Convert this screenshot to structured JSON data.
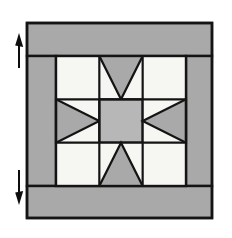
{
  "diagram": {
    "canvas": {
      "width": 232,
      "height": 238,
      "background": "#ffffff"
    },
    "colors": {
      "border_gray": "#a9a9a9",
      "star_gray": "#a9a9a9",
      "center_gray": "#b7b7b7",
      "background_white": "#f6f6f3",
      "outline_black": "#141414",
      "arrow_black": "#0d0d0d",
      "page_white": "#ffffff"
    },
    "block": {
      "label": "quilt-block",
      "outer": {
        "x": 27,
        "y": 23,
        "width": 185,
        "height": 195
      },
      "inner_star": {
        "x": 56,
        "y": 56,
        "width": 130,
        "height": 130
      },
      "grid_columns": 3,
      "grid_rows": 3,
      "cell_size": 43.33,
      "outline_width": 2.2
    },
    "borders": [
      {
        "name": "top-border-strip",
        "x": 27,
        "y": 23,
        "width": 185,
        "height": 33,
        "fill": "#a9a9a9"
      },
      {
        "name": "bottom-border-strip",
        "x": 27,
        "y": 186,
        "width": 185,
        "height": 32,
        "fill": "#a9a9a9"
      },
      {
        "name": "left-border-strip",
        "x": 27,
        "y": 56,
        "width": 29,
        "height": 130,
        "fill": "#a9a9a9"
      },
      {
        "name": "right-border-strip",
        "x": 186,
        "y": 56,
        "width": 26,
        "height": 130,
        "fill": "#a9a9a9"
      }
    ],
    "star_units": [
      {
        "name": "corner-square-top-left",
        "type": "square",
        "row": 0,
        "col": 0,
        "fill": "#f6f6f3"
      },
      {
        "name": "flying-geese-top",
        "type": "flying-geese",
        "row": 0,
        "col": 1,
        "point": "down",
        "fill": "#a9a9a9",
        "background": "#f6f6f3"
      },
      {
        "name": "corner-square-top-right",
        "type": "square",
        "row": 0,
        "col": 2,
        "fill": "#f6f6f3"
      },
      {
        "name": "flying-geese-left",
        "type": "flying-geese",
        "row": 1,
        "col": 0,
        "point": "right",
        "fill": "#a9a9a9",
        "background": "#f6f6f3"
      },
      {
        "name": "center-square",
        "type": "square",
        "row": 1,
        "col": 1,
        "fill": "#b7b7b7"
      },
      {
        "name": "flying-geese-right",
        "type": "flying-geese",
        "row": 1,
        "col": 2,
        "point": "left",
        "fill": "#a9a9a9",
        "background": "#f6f6f3"
      },
      {
        "name": "corner-square-bottom-left",
        "type": "square",
        "row": 2,
        "col": 0,
        "fill": "#f6f6f3"
      },
      {
        "name": "flying-geese-bottom",
        "type": "flying-geese",
        "row": 2,
        "col": 1,
        "point": "up",
        "fill": "#a9a9a9",
        "background": "#f6f6f3"
      },
      {
        "name": "corner-square-bottom-right",
        "type": "square",
        "row": 2,
        "col": 2,
        "fill": "#f6f6f3"
      }
    ],
    "annotations": [
      {
        "name": "arrow-up-top-border",
        "direction": "up",
        "x": 17,
        "y": 32,
        "length": 34,
        "label": ""
      },
      {
        "name": "arrow-down-bottom-border",
        "direction": "down",
        "x": 17,
        "y": 168,
        "length": 34,
        "label": ""
      }
    ]
  }
}
